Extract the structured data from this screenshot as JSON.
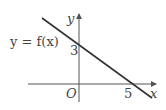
{
  "diagram": {
    "function_label": "y = f(x)",
    "x_axis_label": "x",
    "y_axis_label": "y",
    "origin_label": "O",
    "y_intercept_label": "3",
    "x_intercept_label": "5",
    "line_color": "#333333",
    "axis_color": "#555555"
  }
}
